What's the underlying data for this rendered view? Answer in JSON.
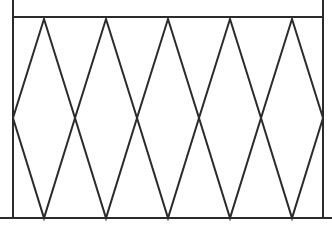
{
  "diagram": {
    "stroke_color": "#2b2b2b",
    "stroke_width": 2,
    "background": "#ffffff",
    "frame": {
      "left_x": 13,
      "right_x": 323,
      "top_y": 0,
      "rail_y": 17,
      "bottom_y": 218
    },
    "ground": {
      "y": 218,
      "x1": 0,
      "x2": 332
    },
    "diamonds": {
      "count": 5,
      "width": 62,
      "top_y": 19,
      "mid_y": 118,
      "bottom_y": 218,
      "centers_x": [
        44,
        106,
        168,
        230,
        292
      ]
    }
  }
}
